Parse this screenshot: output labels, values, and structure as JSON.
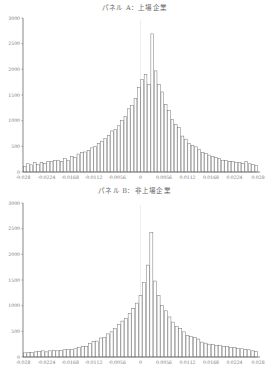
{
  "chart_data": [
    {
      "type": "bar",
      "title": "パネル A：上場企業",
      "xlabel": "",
      "ylabel": "",
      "ylim": [
        0,
        3000
      ],
      "yticks": [
        0,
        500,
        1000,
        1500,
        2000,
        2500,
        3000
      ],
      "xticks": [
        "-0.028",
        "-0.0224",
        "-0.0168",
        "-0.0112",
        "-0.0056",
        "0",
        "0.0056",
        "0.0112",
        "0.0168",
        "0.0224",
        "0.028"
      ],
      "xlim": [
        -0.028,
        0.028
      ],
      "grid": false,
      "bin_count": 50,
      "values": [
        110,
        160,
        140,
        180,
        150,
        190,
        170,
        210,
        200,
        220,
        230,
        200,
        260,
        230,
        300,
        280,
        350,
        380,
        390,
        420,
        470,
        500,
        550,
        600,
        650,
        710,
        800,
        830,
        900,
        1000,
        1080,
        1230,
        1300,
        1430,
        1650,
        1800,
        1900,
        1700,
        2690,
        1970,
        1700,
        1560,
        1320,
        1200,
        1020,
        920,
        870,
        700,
        640,
        560
      ],
      "values_right_tail": [
        520,
        490,
        440,
        380,
        360,
        330,
        300,
        280,
        260,
        230,
        220,
        210,
        200,
        190,
        180,
        170,
        200,
        160,
        150,
        130
      ]
    },
    {
      "type": "bar",
      "title": "パネル B：非上場企業",
      "xlabel": "",
      "ylabel": "",
      "ylim": [
        0,
        3000
      ],
      "yticks": [
        0,
        500,
        1000,
        1500,
        2000,
        2500,
        3000
      ],
      "xticks": [
        "-0.028",
        "-0.0224",
        "-0.0168",
        "-0.0112",
        "-0.0056",
        "0",
        "0.0056",
        "0.0112",
        "0.0168",
        "0.0224",
        "0.028"
      ],
      "xlim": [
        -0.028,
        0.028
      ],
      "grid": false,
      "bin_count": 50,
      "values": [
        80,
        90,
        90,
        100,
        110,
        120,
        100,
        120,
        130,
        120,
        130,
        140,
        150,
        150,
        160,
        190,
        200,
        210,
        260,
        300,
        310,
        370,
        380,
        450,
        490,
        560,
        630,
        700,
        750,
        850,
        950,
        1050,
        1200,
        1450,
        1790,
        2430,
        1480,
        1200,
        1000,
        900,
        780,
        680,
        600,
        560,
        490,
        420,
        400,
        380,
        350,
        290
      ],
      "values_right_tail": [
        270,
        250,
        240,
        220,
        230,
        210,
        200,
        180,
        190,
        170,
        160,
        150,
        140,
        120,
        110
      ]
    }
  ],
  "panels": [
    {
      "title": "パネル A：上場企業",
      "yticks": [
        "0",
        "500",
        "1000",
        "1500",
        "2000",
        "2500",
        "3000"
      ],
      "xticks": [
        "-0.028",
        "-0.0224",
        "-0.0168",
        "-0.0112",
        "-0.0056",
        "0",
        "0.0056",
        "0.0112",
        "0.0168",
        "0.0224",
        "0.028"
      ]
    },
    {
      "title": "パネル B：非上場企業",
      "yticks": [
        "0",
        "500",
        "1000",
        "1500",
        "2000",
        "2500",
        "3000"
      ],
      "xticks": [
        "-0.028",
        "-0.0224",
        "-0.0168",
        "-0.0112",
        "-0.0056",
        "0",
        "0.0056",
        "0.0112",
        "0.0168",
        "0.0224",
        "0.028"
      ]
    }
  ]
}
